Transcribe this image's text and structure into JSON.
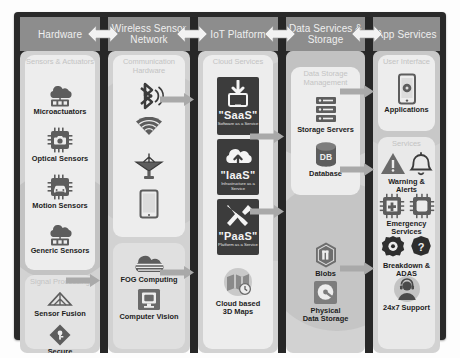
{
  "diagram": {
    "frame_color": "#2a2a2a",
    "header_color": "#8d8d8d",
    "body_color": "#d2d2d2",
    "panel_color": "#ededed",
    "tile_color": "#3c3c3c"
  },
  "columns": [
    {
      "id": "hardware",
      "header": "Hardware",
      "groups": [
        {
          "title": "Sensors &\nActuators",
          "items": [
            {
              "label": "Microactuators",
              "icon": "cloud-actuator-icon"
            },
            {
              "label": "Optical Sensors",
              "icon": "camera-chip-icon"
            },
            {
              "label": "Motion Sensors",
              "icon": "car-chip-icon"
            },
            {
              "label": "Generic Sensors",
              "icon": "cloud-sensor-icon"
            }
          ]
        },
        {
          "title": "Signal Processing",
          "items": [
            {
              "label": "Sensor Fusion",
              "icon": "fusion-triangle-icon"
            },
            {
              "label": "Secure",
              "icon": "shield-key-icon"
            }
          ]
        }
      ]
    },
    {
      "id": "wireless-sensor-network",
      "header": "Wireless Sensor\nNetwork",
      "groups": [
        {
          "title": "Communication\nHardware",
          "items": [
            {
              "label": "",
              "icon": "bluetooth-icon"
            },
            {
              "label": "",
              "icon": "wifi-icon"
            },
            {
              "label": "",
              "icon": "satellite-dish-icon"
            },
            {
              "label": "",
              "icon": "tablet-icon"
            }
          ]
        },
        {
          "title": "",
          "items": [
            {
              "label": "FOG Computing",
              "icon": "fog-cloud-icon"
            },
            {
              "label": "Computer Vision",
              "icon": "vision-monitor-icon"
            }
          ]
        }
      ]
    },
    {
      "id": "iot-platform",
      "header": "IoT Platform",
      "groups": [
        {
          "title": "Cloud\nServices",
          "tiles": [
            {
              "name": "\"SaaS\"",
              "sub": "Software as a Service",
              "icon": "download-monitor-icon"
            },
            {
              "name": "\"IaaS\"",
              "sub": "Infrastructure as a Service",
              "icon": "cloud-upload-icon"
            },
            {
              "name": "\"PaaS\"",
              "sub": "Platform as a Service",
              "icon": "wrench-screwdriver-icon"
            }
          ],
          "items": [
            {
              "label": "Cloud based\n3D Maps",
              "icon": "map-3d-icon"
            }
          ]
        }
      ]
    },
    {
      "id": "data-services-storage",
      "header": "Data\nServices &\nStorage",
      "groups": [
        {
          "title": "Data Storage\nManagement",
          "items": [
            {
              "label": "Storage Servers",
              "icon": "server-rack-icon"
            },
            {
              "label": "Database",
              "icon": "database-icon"
            }
          ]
        },
        {
          "title": "",
          "items": [
            {
              "label": "Blobs",
              "icon": "blob-hexagon-icon"
            },
            {
              "label": "Physical\nData Storage",
              "icon": "hard-disk-icon"
            }
          ]
        }
      ]
    },
    {
      "id": "app-services",
      "header": "App\nServices",
      "groups": [
        {
          "title": "User Interface",
          "items": [
            {
              "label": "Applications",
              "icon": "smartphone-app-icon"
            }
          ]
        },
        {
          "title": "Services",
          "items": [
            {
              "label": "Warning & Alerts",
              "icon": "warning-bell-icon"
            },
            {
              "label": "Emergency Services",
              "icon": "emergency-chips-icon"
            },
            {
              "label": "Breakdown & ADAS",
              "icon": "gear-question-icon"
            },
            {
              "label": "24x7 Support",
              "icon": "support-agent-icon"
            }
          ]
        }
      ]
    }
  ],
  "connectors": {
    "header_arrows": 4,
    "link_arrows": 5,
    "direction": "bidirectional"
  }
}
